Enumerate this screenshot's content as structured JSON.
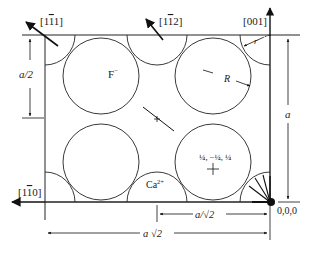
{
  "diagram": {
    "directions": {
      "d_1m11": "[1̅1]",
      "d_1m11_display": "[1¯11]",
      "d_1m12": "[1¯12]",
      "d_001": "[001]",
      "d_1m10": "[1¯10]"
    },
    "direction_labels": {
      "top_left": "[1",
      "top_left_bar": "1",
      "top_left_end": "1]",
      "top_mid": "[1",
      "top_mid_bar": "1",
      "top_mid_end": "2]",
      "top_right": "[001]",
      "left": "[1",
      "left_bar": "1",
      "left_end": "0]"
    },
    "ions": {
      "anion": "F",
      "anion_charge": "−",
      "cation": "Ca",
      "cation_charge": "2+"
    },
    "radii": {
      "large": "R",
      "small": "r"
    },
    "coordinates": {
      "origin": "0,0,0",
      "site_frac": "¼, −¼, ¼"
    },
    "dimensions": {
      "half_a": "a/2",
      "a": "a",
      "a_over_root2": "a/√2",
      "a_root2": "a √2"
    }
  }
}
